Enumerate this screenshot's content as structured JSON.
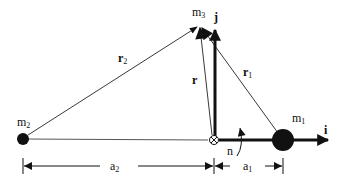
{
  "labels": {
    "m1": {
      "base": "m",
      "sub": "1"
    },
    "m2": {
      "base": "m",
      "sub": "2"
    },
    "m3": {
      "base": "m",
      "sub": "3"
    },
    "r": {
      "base": "r",
      "sub": ""
    },
    "r1": {
      "base": "r",
      "sub": "1"
    },
    "r2": {
      "base": "r",
      "sub": "2"
    },
    "i": "i",
    "j": "j",
    "n": "n",
    "a1": {
      "base": "a",
      "sub": "1"
    },
    "a2": {
      "base": "a",
      "sub": "2"
    }
  },
  "points": {
    "m2": {
      "x": 23,
      "y": 139,
      "radius": 6
    },
    "origin": {
      "x": 214,
      "y": 140
    },
    "m1": {
      "x": 283,
      "y": 140,
      "radius": 11
    },
    "m3": {
      "x": 199,
      "y": 25
    }
  },
  "colors": {
    "ink": "#111111",
    "background": "#ffffff"
  }
}
